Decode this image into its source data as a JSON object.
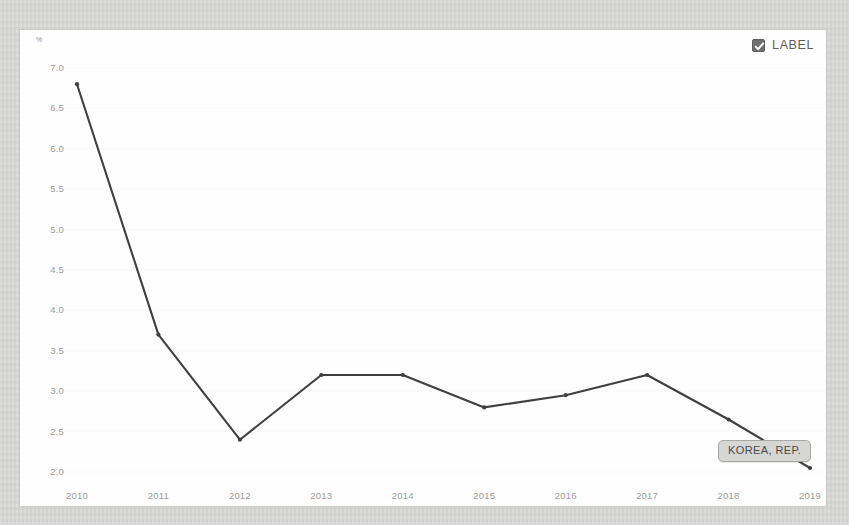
{
  "legend": {
    "label": "LABEL",
    "checked": true,
    "checkbox_icon": "check-icon",
    "checkbox_color": "#6f6f6f"
  },
  "axis": {
    "unit_label": "%"
  },
  "annotation": {
    "label": "KOREA, REP."
  },
  "chart_data": {
    "type": "line",
    "title": "",
    "subtitle": "",
    "xlabel": "",
    "ylabel": "%",
    "x": [
      2010,
      2011,
      2012,
      2013,
      2014,
      2015,
      2016,
      2017,
      2018,
      2019
    ],
    "categories": [
      "2010",
      "2011",
      "2012",
      "2013",
      "2014",
      "2015",
      "2016",
      "2017",
      "2018",
      "2019"
    ],
    "series": [
      {
        "name": "KOREA, REP.",
        "color": "#3f3f3f",
        "values": [
          6.8,
          3.7,
          2.4,
          3.2,
          3.2,
          2.8,
          2.95,
          3.2,
          2.65,
          2.05
        ]
      }
    ],
    "ylim": [
      2.0,
      7.0
    ],
    "yticks": [
      7.0,
      6.5,
      6.0,
      5.5,
      5.0,
      4.5,
      4.0,
      3.5,
      3.0,
      2.5,
      2.0
    ],
    "ytick_labels": [
      "7.0",
      "6.5",
      "6.0",
      "5.5",
      "5.0",
      "4.5",
      "4.0",
      "3.5",
      "3.0",
      "2.5",
      "2.0"
    ],
    "xtick_labels": [
      "2010",
      "2011",
      "2012",
      "2013",
      "2014",
      "2015",
      "2016",
      "2017",
      "2018",
      "2019"
    ],
    "grid": true,
    "grid_style": "dotted",
    "grid_color": "#ececec",
    "legend_position": "top-right",
    "marker": "dot",
    "annotations": [
      {
        "label": "KOREA, REP.",
        "x": 2019,
        "y": 2.05
      }
    ]
  }
}
